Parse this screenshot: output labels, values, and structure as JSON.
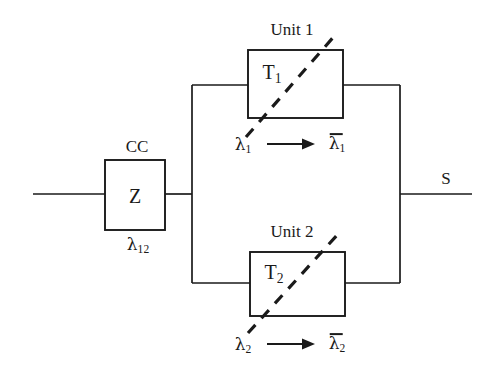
{
  "figure": {
    "type": "reliability-block-diagram",
    "background_color": "#ffffff",
    "line_color": "#1a1a1a",
    "text_color": "#1a1a1a"
  },
  "common_cause": {
    "title": "CC",
    "block_label": "Z",
    "rate_symbol": "λ",
    "rate_subscript": "12"
  },
  "units": [
    {
      "title": "Unit 1",
      "block_label": "T",
      "block_subscript": "1",
      "rate_from_symbol": "λ",
      "rate_from_subscript": "1",
      "transition_arrow": "⟶",
      "rate_to_symbol": "λ",
      "rate_to_subscript": "1",
      "rate_to_overbar": true
    },
    {
      "title": "Unit 2",
      "block_label": "T",
      "block_subscript": "2",
      "rate_from_symbol": "λ",
      "rate_from_subscript": "2",
      "transition_arrow": "⟶",
      "rate_to_symbol": "λ",
      "rate_to_subscript": "2",
      "rate_to_overbar": true
    }
  ],
  "output": {
    "label": "S"
  }
}
